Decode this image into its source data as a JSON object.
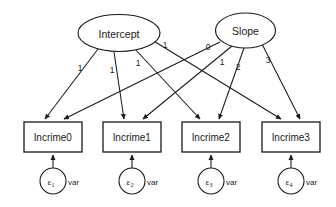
{
  "diagram": {
    "type": "sem-path-diagram",
    "latent_variables": [
      {
        "id": "intercept",
        "label": "Intercept",
        "shape": "ellipse",
        "cx": 119,
        "cy": 33,
        "rx": 41,
        "ry": 18.5
      },
      {
        "id": "slope",
        "label": "Slope",
        "shape": "ellipse",
        "cx": 245.5,
        "cy": 30.5,
        "rx": 30,
        "ry": 17.5
      }
    ],
    "observed_variables": [
      {
        "id": "lncrime0",
        "label": "lncrime0",
        "shape": "rect",
        "x": 24,
        "y": 122,
        "w": 58,
        "h": 30
      },
      {
        "id": "lncrime1",
        "label": "lncrime1",
        "shape": "rect",
        "x": 103,
        "y": 122,
        "w": 58,
        "h": 30
      },
      {
        "id": "lncrime2",
        "label": "lncrime2",
        "shape": "rect",
        "x": 182,
        "y": 122,
        "w": 58,
        "h": 30
      },
      {
        "id": "lncrime3",
        "label": "lncrime3",
        "shape": "rect",
        "x": 262,
        "y": 122,
        "w": 58,
        "h": 30
      }
    ],
    "error_terms": [
      {
        "id": "e1",
        "symbol": "ε",
        "subscript": "1",
        "var_label": "var",
        "cx": 53,
        "cy": 181,
        "r": 13
      },
      {
        "id": "e2",
        "symbol": "ε",
        "subscript": "2",
        "var_label": "var",
        "cx": 132,
        "cy": 181,
        "r": 13
      },
      {
        "id": "e3",
        "symbol": "ε",
        "subscript": "3",
        "var_label": "var",
        "cx": 211,
        "cy": 181,
        "r": 13
      },
      {
        "id": "e4",
        "symbol": "ε",
        "subscript": "4",
        "var_label": "var",
        "cx": 291,
        "cy": 181,
        "r": 13
      }
    ],
    "paths": [
      {
        "id": "int-c0",
        "from": "intercept",
        "to": "lncrime0",
        "weight": "1",
        "x1": 98,
        "y1": 49,
        "x2": 45,
        "y2": 119,
        "lx": 80,
        "ly": 68
      },
      {
        "id": "int-c1",
        "from": "intercept",
        "to": "lncrime1",
        "weight": "1",
        "x1": 114,
        "y1": 52,
        "x2": 124,
        "y2": 119,
        "lx": 112,
        "ly": 70
      },
      {
        "id": "int-c2",
        "from": "intercept",
        "to": "lncrime2",
        "weight": "1",
        "x1": 134,
        "y1": 48,
        "x2": 200,
        "y2": 119,
        "lx": 138,
        "ly": 63
      },
      {
        "id": "int-c3",
        "from": "intercept",
        "to": "lncrime3",
        "weight": "1",
        "x1": 152,
        "y1": 40,
        "x2": 281,
        "y2": 119,
        "lx": 165,
        "ly": 45
      },
      {
        "id": "slp-c0",
        "from": "slope",
        "to": "lncrime0",
        "weight": "0",
        "x1": 220,
        "y1": 42,
        "x2": 64,
        "y2": 119,
        "lx": 208,
        "ly": 47
      },
      {
        "id": "slp-c1",
        "from": "slope",
        "to": "lncrime1",
        "weight": "1",
        "x1": 232,
        "y1": 46,
        "x2": 143,
        "y2": 119,
        "lx": 222,
        "ly": 62
      },
      {
        "id": "slp-c2",
        "from": "slope",
        "to": "lncrime2",
        "weight": "2",
        "x1": 244,
        "y1": 48,
        "x2": 219,
        "y2": 119,
        "lx": 238,
        "ly": 67
      },
      {
        "id": "slp-c3",
        "from": "slope",
        "to": "lncrime3",
        "weight": "3",
        "x1": 262,
        "y1": 44,
        "x2": 300,
        "y2": 119,
        "lx": 268,
        "ly": 60
      }
    ],
    "error_paths": [
      {
        "id": "e1-c0",
        "from": "e1",
        "to": "lncrime0",
        "x1": 53,
        "y1": 168,
        "x2": 53,
        "y2": 155
      },
      {
        "id": "e2-c1",
        "from": "e2",
        "to": "lncrime1",
        "x1": 132,
        "y1": 168,
        "x2": 132,
        "y2": 155
      },
      {
        "id": "e3-c2",
        "from": "e3",
        "to": "lncrime2",
        "x1": 211,
        "y1": 168,
        "x2": 211,
        "y2": 155
      },
      {
        "id": "e4-c3",
        "from": "e4",
        "to": "lncrime3",
        "x1": 291,
        "y1": 168,
        "x2": 291,
        "y2": 155
      }
    ],
    "colors": {
      "stroke": "#1a1a1a",
      "fill": "#ffffff",
      "background": "#ffffff"
    }
  }
}
